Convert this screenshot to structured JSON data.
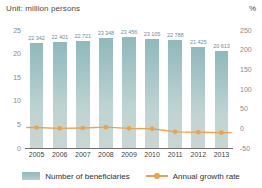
{
  "header": {
    "unit_label": "Unit: million persons",
    "percent_label": "%"
  },
  "legend": {
    "bar_label": "Number of beneficiaries",
    "line_label": "Annual growth rate"
  },
  "colors": {
    "bar_top": "#8fb9bc",
    "bar_bottom": "#c9d6d4",
    "line": "#eda24a",
    "axis": "#6d6d6d",
    "tick_text": "#8a8a8a",
    "value_text": "#6f8f97"
  },
  "chart_data": {
    "type": "bar",
    "title": "",
    "subtitle": "",
    "xlabel": "",
    "ylabel": "Unit: million persons",
    "y2label": "%",
    "categories": [
      "2005",
      "2006",
      "2007",
      "2008",
      "2009",
      "2010",
      "2011",
      "2012",
      "2013"
    ],
    "series": [
      {
        "name": "Number of beneficiaries",
        "type": "bar",
        "axis": "left",
        "unit": "million persons",
        "values": [
          22.342,
          22.401,
          22.721,
          23.348,
          23.456,
          23.105,
          22.788,
          21.425,
          20.613
        ],
        "labels": [
          "22 342",
          "22 401",
          "22 721",
          "23 348",
          "23 456",
          "23 105",
          "22 788",
          "21 425",
          "20 613"
        ]
      },
      {
        "name": "Annual growth rate",
        "type": "line",
        "axis": "right",
        "unit": "%",
        "values": [
          2,
          0,
          1,
          3,
          0,
          -1,
          -9,
          -10,
          -11
        ]
      }
    ],
    "yticks": [
      "0",
      "5",
      "10",
      "15",
      "20",
      "25"
    ],
    "ylim": [
      0,
      25
    ],
    "y2ticks": [
      "-50",
      "0",
      "50",
      "100",
      "150",
      "200",
      "250"
    ],
    "y2lim": [
      -50,
      250
    ],
    "grid": false,
    "legend_position": "bottom"
  }
}
